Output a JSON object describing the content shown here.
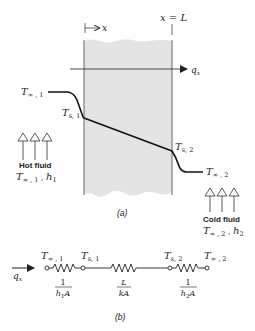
{
  "figure": {
    "panel_a": {
      "label": "(a)",
      "position_label": "x = L",
      "x_axis_label": "x",
      "heat_flux_label": {
        "symbol": "q",
        "sub": "x"
      },
      "temperatures": {
        "t_inf_1": {
          "symbol": "T",
          "sub": "∞ , 1"
        },
        "t_s_1": {
          "symbol": "T",
          "sub": "s, 1"
        },
        "t_s_2": {
          "symbol": "T",
          "sub": "s, 2"
        },
        "t_inf_2": {
          "symbol": "T",
          "sub": "∞ , 2"
        }
      },
      "hot_fluid": {
        "title": "Hot fluid",
        "props": {
          "t": "T",
          "t_sub": "∞ , 1",
          "sep": " , ",
          "h": "h",
          "h_sub": "1"
        }
      },
      "cold_fluid": {
        "title": "Cold fluid",
        "props": {
          "t": "T",
          "t_sub": "∞ , 2",
          "sep": " , ",
          "h": "h",
          "h_sub": "2"
        }
      },
      "wall_fill_color": "#e4e4e4",
      "line_color": "#222222"
    },
    "panel_b": {
      "label": "(b)",
      "heat_flux_label": {
        "symbol": "q",
        "sub": "x"
      },
      "nodes": [
        {
          "symbol": "T",
          "sub": "∞ , 1"
        },
        {
          "symbol": "T",
          "sub": "s, 1"
        },
        {
          "symbol": "T",
          "sub": "s, 2"
        },
        {
          "symbol": "T",
          "sub": "∞ , 2"
        }
      ],
      "resistances": [
        {
          "num": "1",
          "den": "h",
          "den_sub": "1",
          "den_tail": "A"
        },
        {
          "num": "L",
          "den": "kA",
          "den_sub": "",
          "den_tail": ""
        },
        {
          "num": "1",
          "den": "h",
          "den_sub": "2",
          "den_tail": "A"
        }
      ]
    }
  }
}
